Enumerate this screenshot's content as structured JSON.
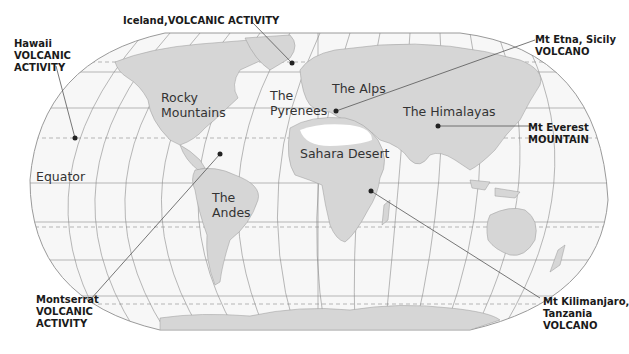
{
  "colors": {
    "background": "#ffffff",
    "ocean": "#f7f7f7",
    "land": "#d6d6d6",
    "desert": "#ffffff",
    "grid": "#8a8a8a",
    "outline": "#9a9a9a",
    "marker": "#222222",
    "leader": "#555555"
  },
  "map": {
    "projection": "world-rounded",
    "equator_label": "Equator",
    "regions": [
      {
        "id": "rocky",
        "line1": "Rocky",
        "line2": "Mountains"
      },
      {
        "id": "andes",
        "line1": "The",
        "line2": "Andes"
      },
      {
        "id": "pyrenees",
        "line1": "The",
        "line2": "Pyrenees"
      },
      {
        "id": "alps",
        "line1": "The Alps"
      },
      {
        "id": "himalayas",
        "line1": "The Himalayas"
      },
      {
        "id": "sahara",
        "line1": "Sahara Desert"
      }
    ],
    "callouts": [
      {
        "id": "hawaii",
        "name": "Hawaii",
        "type_line1": "VOLCANIC",
        "type_line2": "ACTIVITY"
      },
      {
        "id": "iceland",
        "name": "Iceland,",
        "type_line1": "VOLCANIC ACTIVITY"
      },
      {
        "id": "etna",
        "name": "Mt Etna, Sicily",
        "type_line1": "VOLCANO"
      },
      {
        "id": "everest",
        "name": "Mt Everest",
        "type_line1": "MOUNTAIN"
      },
      {
        "id": "montserrat",
        "name": "Montserrat",
        "type_line1": "VOLCANIC",
        "type_line2": "ACTIVITY"
      },
      {
        "id": "kilimanjaro",
        "name": "Mt Kilimanjaro,",
        "name2": "Tanzania",
        "type_line1": "VOLCANO"
      }
    ]
  }
}
